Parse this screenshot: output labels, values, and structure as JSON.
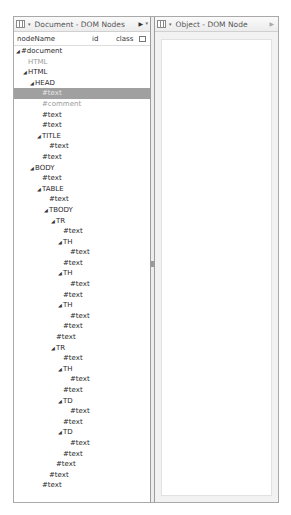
{
  "left_panel": {
    "title": "Document - DOM Nodes",
    "columns": [
      "nodeName",
      "id",
      "class"
    ],
    "nodes": [
      {
        "label": "#document",
        "indent": 0,
        "expander": true,
        "style": ""
      },
      {
        "label": "HTML",
        "indent": 1,
        "expander": false,
        "style": "grey"
      },
      {
        "label": "HTML",
        "indent": 1,
        "expander": true,
        "style": ""
      },
      {
        "label": "HEAD",
        "indent": 2,
        "expander": true,
        "style": ""
      },
      {
        "label": "#text",
        "indent": 3,
        "expander": false,
        "style": "sel"
      },
      {
        "label": "#comment",
        "indent": 3,
        "expander": false,
        "style": "grey"
      },
      {
        "label": "#text",
        "indent": 3,
        "expander": false,
        "style": ""
      },
      {
        "label": "#text",
        "indent": 3,
        "expander": false,
        "style": ""
      },
      {
        "label": "TITLE",
        "indent": 3,
        "expander": true,
        "style": ""
      },
      {
        "label": "#text",
        "indent": 4,
        "expander": false,
        "style": ""
      },
      {
        "label": "#text",
        "indent": 3,
        "expander": false,
        "style": ""
      },
      {
        "label": "BODY",
        "indent": 2,
        "expander": true,
        "style": ""
      },
      {
        "label": "#text",
        "indent": 3,
        "expander": false,
        "style": ""
      },
      {
        "label": "TABLE",
        "indent": 3,
        "expander": true,
        "style": ""
      },
      {
        "label": "#text",
        "indent": 4,
        "expander": false,
        "style": ""
      },
      {
        "label": "TBODY",
        "indent": 4,
        "expander": true,
        "style": ""
      },
      {
        "label": "TR",
        "indent": 5,
        "expander": true,
        "style": ""
      },
      {
        "label": "#text",
        "indent": 6,
        "expander": false,
        "style": ""
      },
      {
        "label": "TH",
        "indent": 6,
        "expander": true,
        "style": ""
      },
      {
        "label": "#text",
        "indent": 7,
        "expander": false,
        "style": ""
      },
      {
        "label": "#text",
        "indent": 6,
        "expander": false,
        "style": ""
      },
      {
        "label": "TH",
        "indent": 6,
        "expander": true,
        "style": ""
      },
      {
        "label": "#text",
        "indent": 7,
        "expander": false,
        "style": ""
      },
      {
        "label": "#text",
        "indent": 6,
        "expander": false,
        "style": ""
      },
      {
        "label": "TH",
        "indent": 6,
        "expander": true,
        "style": ""
      },
      {
        "label": "#text",
        "indent": 7,
        "expander": false,
        "style": ""
      },
      {
        "label": "#text",
        "indent": 6,
        "expander": false,
        "style": ""
      },
      {
        "label": "#text",
        "indent": 5,
        "expander": false,
        "style": ""
      },
      {
        "label": "TR",
        "indent": 5,
        "expander": true,
        "style": ""
      },
      {
        "label": "#text",
        "indent": 6,
        "expander": false,
        "style": ""
      },
      {
        "label": "TH",
        "indent": 6,
        "expander": true,
        "style": ""
      },
      {
        "label": "#text",
        "indent": 7,
        "expander": false,
        "style": ""
      },
      {
        "label": "#text",
        "indent": 6,
        "expander": false,
        "style": ""
      },
      {
        "label": "TD",
        "indent": 6,
        "expander": true,
        "style": ""
      },
      {
        "label": "#text",
        "indent": 7,
        "expander": false,
        "style": ""
      },
      {
        "label": "#text",
        "indent": 6,
        "expander": false,
        "style": ""
      },
      {
        "label": "TD",
        "indent": 6,
        "expander": true,
        "style": ""
      },
      {
        "label": "#text",
        "indent": 7,
        "expander": false,
        "style": ""
      },
      {
        "label": "#text",
        "indent": 6,
        "expander": false,
        "style": ""
      },
      {
        "label": "#text",
        "indent": 5,
        "expander": false,
        "style": ""
      },
      {
        "label": "#text",
        "indent": 4,
        "expander": false,
        "style": ""
      },
      {
        "label": "#text",
        "indent": 3,
        "expander": false,
        "style": ""
      }
    ]
  },
  "right_panel": {
    "title": "Object - DOM Node"
  },
  "icons": {
    "panel_icon": "grid-view-icon",
    "dropdown": "▾",
    "nav_arrow": "▶",
    "expander": "◢"
  },
  "colors": {
    "selection": "#a0a0a0",
    "grey_text": "#9a9a9a",
    "border": "#a9a9a9"
  }
}
